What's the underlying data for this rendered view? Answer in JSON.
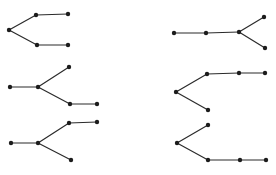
{
  "canvas": {
    "width": 276,
    "height": 175,
    "background_color": "#ffffff"
  },
  "style": {
    "dot_color": "#1c1c1c",
    "line_color": "#2b2b2b",
    "dot_radius": 2.2,
    "line_width": 1.2
  },
  "chart_data": {
    "type": "table",
    "trees": [
      {
        "id": "tree-top-left",
        "shape": "left vertex forking into two horizontally-extended branches (bent path)",
        "vertices": [
          [
            9,
            30
          ],
          [
            36,
            15
          ],
          [
            68,
            14
          ],
          [
            37,
            45
          ],
          [
            68,
            45
          ]
        ],
        "edges": [
          [
            0,
            1
          ],
          [
            1,
            2
          ],
          [
            0,
            3
          ],
          [
            3,
            4
          ]
        ]
      },
      {
        "id": "tree-top-right",
        "shape": "horizontal three-vertex path forking at right end into two short branches",
        "vertices": [
          [
            174,
            33
          ],
          [
            206,
            33
          ],
          [
            239,
            32
          ],
          [
            264,
            17
          ],
          [
            265,
            48
          ]
        ],
        "edges": [
          [
            0,
            1
          ],
          [
            1,
            2
          ],
          [
            2,
            3
          ],
          [
            2,
            4
          ]
        ]
      },
      {
        "id": "tree-middle-left",
        "shape": "left vertex to junction; short upper branch, lower branch extended horizontally",
        "vertices": [
          [
            10,
            87
          ],
          [
            38,
            87
          ],
          [
            69,
            67
          ],
          [
            70,
            104
          ],
          [
            97,
            104
          ]
        ],
        "edges": [
          [
            0,
            1
          ],
          [
            1,
            2
          ],
          [
            1,
            3
          ],
          [
            3,
            4
          ]
        ]
      },
      {
        "id": "tree-middle-right",
        "shape": "junction with upper branch extending into horizontal three-vertex path and short lower branch (bent path)",
        "vertices": [
          [
            176,
            92
          ],
          [
            207,
            74
          ],
          [
            239,
            73
          ],
          [
            265,
            73
          ],
          [
            208,
            110
          ]
        ],
        "edges": [
          [
            0,
            1
          ],
          [
            1,
            2
          ],
          [
            2,
            3
          ],
          [
            0,
            4
          ]
        ]
      },
      {
        "id": "tree-bottom-left",
        "shape": "left vertex to junction; upper branch extended horizontally, short lower branch",
        "vertices": [
          [
            11,
            143
          ],
          [
            38,
            143
          ],
          [
            69,
            123
          ],
          [
            97,
            122
          ],
          [
            71,
            160
          ]
        ],
        "edges": [
          [
            0,
            1
          ],
          [
            1,
            2
          ],
          [
            2,
            3
          ],
          [
            1,
            4
          ]
        ]
      },
      {
        "id": "tree-bottom-right",
        "shape": "junction with short upper branch and lower branch extending into horizontal three-vertex path (bent path)",
        "vertices": [
          [
            208,
            125
          ],
          [
            177,
            143
          ],
          [
            208,
            160
          ],
          [
            240,
            160
          ],
          [
            266,
            160
          ]
        ],
        "edges": [
          [
            1,
            0
          ],
          [
            1,
            2
          ],
          [
            2,
            3
          ],
          [
            3,
            4
          ]
        ]
      }
    ]
  }
}
